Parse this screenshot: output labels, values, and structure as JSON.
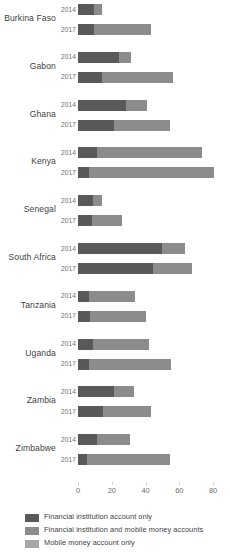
{
  "chart_data": {
    "type": "bar",
    "orientation": "horizontal",
    "stacked": true,
    "title": "",
    "xlabel": "",
    "ylabel": "",
    "xlim": [
      0,
      85
    ],
    "xticks": [
      0,
      20,
      40,
      60,
      80
    ],
    "xtick_labels": [
      "0",
      "20",
      "40",
      "60",
      "80"
    ],
    "grid": false,
    "legend_position": "bottom-left",
    "series": [
      {
        "name": "Financial institution account only",
        "color": "#595959"
      },
      {
        "name": "Financial institution and mobile money accounts",
        "color": "#8c8c8c"
      },
      {
        "name": "Mobile money account only",
        "color": "#a6a6a6"
      }
    ],
    "categories": [
      "Burkina Faso",
      "Gabon",
      "Ghana",
      "Kenya",
      "Senegal",
      "South Africa",
      "Tanzania",
      "Uganda",
      "Zambia",
      "Zimbabwe"
    ],
    "years": [
      "2014",
      "2017"
    ],
    "groups": [
      {
        "country": "Burkina Faso",
        "rows": [
          {
            "year": "2014",
            "values": [
              9.5,
              4.5,
              0
            ],
            "total": 14
          },
          {
            "year": "2017",
            "values": [
              9.5,
              33.5,
              0
            ],
            "total": 43
          }
        ]
      },
      {
        "country": "Gabon",
        "rows": [
          {
            "year": "2014",
            "values": [
              24,
              7.5,
              0
            ],
            "total": 31.5
          },
          {
            "year": "2017",
            "values": [
              14.5,
              41.5,
              0
            ],
            "total": 56
          }
        ]
      },
      {
        "country": "Ghana",
        "rows": [
          {
            "year": "2014",
            "values": [
              28.5,
              12.5,
              0
            ],
            "total": 41
          },
          {
            "year": "2017",
            "values": [
              21.5,
              33,
              0
            ],
            "total": 54.5
          }
        ]
      },
      {
        "country": "Kenya",
        "rows": [
          {
            "year": "2014",
            "values": [
              11,
              62.5,
              0
            ],
            "total": 73.5
          },
          {
            "year": "2017",
            "values": [
              6.5,
              74,
              0
            ],
            "total": 80.5
          }
        ]
      },
      {
        "country": "Senegal",
        "rows": [
          {
            "year": "2014",
            "values": [
              9,
              5.5,
              0
            ],
            "total": 14.5
          },
          {
            "year": "2017",
            "values": [
              8.5,
              17.5,
              0
            ],
            "total": 26
          }
        ]
      },
      {
        "country": "South Africa",
        "rows": [
          {
            "year": "2014",
            "values": [
              50,
              13.5,
              0
            ],
            "total": 63.5
          },
          {
            "year": "2017",
            "values": [
              44.5,
              23,
              0
            ],
            "total": 67.5
          }
        ]
      },
      {
        "country": "Tanzania",
        "rows": [
          {
            "year": "2014",
            "values": [
              6.5,
              27,
              0
            ],
            "total": 33.5
          },
          {
            "year": "2017",
            "values": [
              7,
              33,
              0
            ],
            "total": 40
          }
        ]
      },
      {
        "country": "Uganda",
        "rows": [
          {
            "year": "2014",
            "values": [
              9,
              33,
              0
            ],
            "total": 42
          },
          {
            "year": "2017",
            "values": [
              6.5,
              48.5,
              0
            ],
            "total": 55
          }
        ]
      },
      {
        "country": "Zambia",
        "rows": [
          {
            "year": "2014",
            "values": [
              21.5,
              11.5,
              0
            ],
            "total": 33
          },
          {
            "year": "2017",
            "values": [
              15,
              28.5,
              0
            ],
            "total": 43.5
          }
        ]
      },
      {
        "country": "Zimbabwe",
        "rows": [
          {
            "year": "2014",
            "values": [
              11,
              20,
              0
            ],
            "total": 31
          },
          {
            "year": "2017",
            "values": [
              5.5,
              49,
              0
            ],
            "total": 54.5
          }
        ]
      }
    ]
  },
  "legend": {
    "items": [
      {
        "label": "Financial institution account only",
        "color": "#595959"
      },
      {
        "label": "Financial institution and mobile money accounts",
        "color": "#8c8c8c"
      },
      {
        "label": "Mobile money account only",
        "color": "#a6a6a6"
      }
    ]
  }
}
